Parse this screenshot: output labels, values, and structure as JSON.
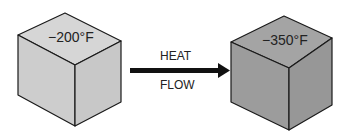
{
  "diagram": {
    "type": "heat-flow-illustration",
    "left_cube": {
      "temperature_label": "−200°F",
      "face_color": "#d2d2d2"
    },
    "right_cube": {
      "temperature_label": "−350°F",
      "face_color": "#9e9e9e"
    },
    "arrow": {
      "label_top": "HEAT",
      "label_bottom": "FLOW",
      "direction": "right"
    }
  }
}
